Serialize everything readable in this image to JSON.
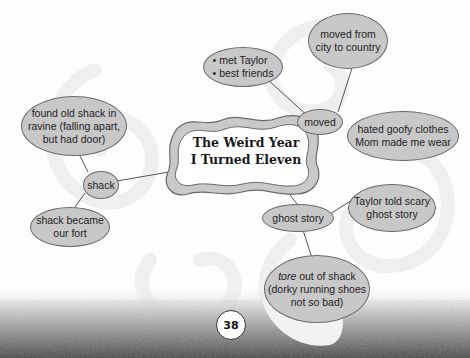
{
  "diagram": {
    "type": "word-web",
    "center": {
      "line1": "The Weird Year",
      "line2": "I Turned Eleven"
    },
    "branches": [
      {
        "label": "moved",
        "details": [
          {
            "lines": [
              "• met Taylor",
              "• best friends"
            ]
          },
          {
            "lines": [
              "moved from",
              "city to country"
            ]
          },
          {
            "lines": [
              "hated goofy clothes",
              "Mom made me wear"
            ]
          }
        ]
      },
      {
        "label": "shack",
        "details": [
          {
            "lines": [
              "found old shack in",
              "ravine (falling apart,",
              "but had door)"
            ]
          },
          {
            "lines": [
              "shack became",
              "our fort"
            ]
          }
        ]
      },
      {
        "label": "ghost story",
        "details": [
          {
            "lines": [
              "Taylor told scary",
              "ghost story"
            ]
          },
          {
            "emphasis": "tore",
            "lines": [
              " out of shack",
              "(dorky running shoes",
              "not so bad)"
            ]
          }
        ]
      }
    ]
  },
  "page": {
    "number": "38"
  },
  "colors": {
    "bubble_fill": "#c8c8c8",
    "bubble_border": "#6a6a6a",
    "line": "#555555",
    "swirl": "#efefef"
  }
}
